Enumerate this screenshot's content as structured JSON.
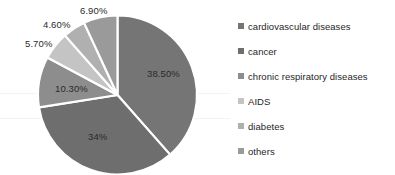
{
  "chart_data": {
    "type": "pie",
    "title": "",
    "categories": [
      "cardiovascular diseases",
      "cancer",
      "chronic respiratory diseases",
      "AIDS",
      "diabetes",
      "others"
    ],
    "values": [
      38.5,
      34,
      10.3,
      5.7,
      4.6,
      6.9
    ],
    "value_labels": [
      "38.50%",
      "34%",
      "10.30%",
      "5.70%",
      "4.60%",
      "6.90%"
    ],
    "colors": [
      "#757575",
      "#6e6e6e",
      "#8d8d8d",
      "#c4c4c4",
      "#b0b0b0",
      "#9a9a9a"
    ],
    "slice_separator_color": "#ffffff",
    "start_angle_deg": 0,
    "direction": "clockwise",
    "legend": {
      "position": "right",
      "entries": [
        {
          "label": "cardiovascular diseases",
          "color": "#757575"
        },
        {
          "label": "cancer",
          "color": "#6e6e6e"
        },
        {
          "label": "chronic respiratory diseases",
          "color": "#8d8d8d"
        },
        {
          "label": "AIDS",
          "color": "#c4c4c4"
        },
        {
          "label": "diabetes",
          "color": "#b0b0b0"
        },
        {
          "label": "others",
          "color": "#9a9a9a"
        }
      ]
    },
    "grid": true,
    "xlabel": "",
    "ylabel": ""
  },
  "labels": {
    "cardiovascular": "38.50%",
    "cancer": "34%",
    "respiratory": "10.30%",
    "aids": "5.70%",
    "diabetes": "4.60%",
    "others": "6.90%"
  },
  "legend_labels": {
    "cardiovascular": "cardiovascular diseases",
    "cancer": "cancer",
    "respiratory": "chronic respiratory diseases",
    "aids": "AIDS",
    "diabetes": "diabetes",
    "others": "others"
  }
}
